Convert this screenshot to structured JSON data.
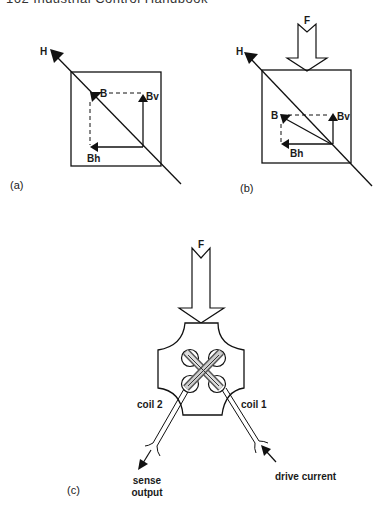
{
  "page": {
    "running_head": "162   Industrial Control Handbook"
  },
  "figure": {
    "panel_a": {
      "caption": "(a)",
      "labels": {
        "H": "H",
        "B": "B",
        "Bv": "Bv",
        "Bh": "Bh"
      }
    },
    "panel_b": {
      "caption": "(b)",
      "labels": {
        "F": "F",
        "H": "H",
        "B": "B",
        "Bv": "Bv",
        "Bh": "Bh"
      }
    },
    "panel_c": {
      "caption": "(c)",
      "labels": {
        "F": "F",
        "coil2": "coil 2",
        "coil1": "coil 1",
        "sense_line1": "sense",
        "sense_line2": "output",
        "drive": "drive current"
      }
    }
  }
}
